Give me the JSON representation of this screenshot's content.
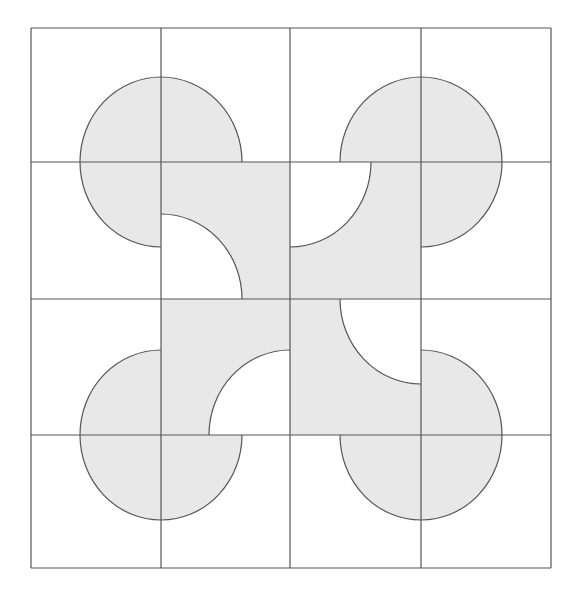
{
  "diagram": {
    "title": "",
    "colors": {
      "fill": "#e8e8e8",
      "line": "#555555",
      "background": "#ffffff"
    },
    "grid": {
      "rows": 4,
      "cols": 4,
      "x_lines": [
        31,
        161,
        290,
        421,
        551
      ],
      "y_lines": [
        28,
        162,
        299,
        435,
        568
      ]
    },
    "radius": {
      "rx": 81,
      "ry": 85
    },
    "three_quarter_circles": [
      {
        "name": "top-left",
        "cx": 161,
        "cy": 162,
        "missing_quadrant": "bottom-right"
      },
      {
        "name": "top-right",
        "cx": 421,
        "cy": 162,
        "missing_quadrant": "bottom-left"
      },
      {
        "name": "bottom-left",
        "cx": 161,
        "cy": 435,
        "missing_quadrant": "top-right"
      },
      {
        "name": "bottom-right",
        "cx": 421,
        "cy": 435,
        "missing_quadrant": "top-left"
      }
    ],
    "center_block": {
      "x": 161,
      "y": 162,
      "width": 260,
      "height": 273,
      "white_cutouts": [
        {
          "cell": "r1c1",
          "cx": 161,
          "cy": 299,
          "corner": "bottom-left"
        },
        {
          "cell": "r1c2",
          "cx": 290,
          "cy": 162,
          "corner": "top-left"
        },
        {
          "cell": "r2c1",
          "cx": 290,
          "cy": 435,
          "corner": "bottom-right"
        },
        {
          "cell": "r2c2",
          "cx": 421,
          "cy": 299,
          "corner": "top-right"
        }
      ]
    }
  }
}
